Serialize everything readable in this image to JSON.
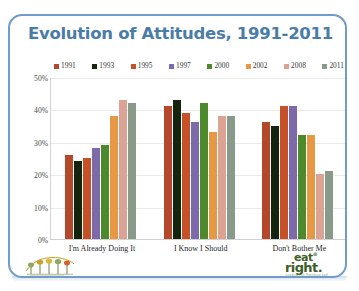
{
  "chart": {
    "title": "Evolution of Attitudes, 1991-2011",
    "title_color": "#4a7ca8",
    "border_color": "#6f9ccb"
  },
  "legend": {
    "items": [
      {
        "label": "1991",
        "color": "#b5472a"
      },
      {
        "label": "1993",
        "color": "#14240e"
      },
      {
        "label": "1995",
        "color": "#c65127"
      },
      {
        "label": "1997",
        "color": "#7e6aa8"
      },
      {
        "label": "2000",
        "color": "#4c8a2b"
      },
      {
        "label": "2002",
        "color": "#e69844"
      },
      {
        "label": "2008",
        "color": "#dba394"
      },
      {
        "label": "2011",
        "color": "#8a9a8a"
      }
    ]
  },
  "yaxis": {
    "ticks": [
      "50%",
      "40%",
      "30%",
      "20%",
      "10%",
      "0%"
    ]
  },
  "logos": {
    "right": {
      "line1": "eat",
      "line2": "right",
      "trademark": "®",
      "period": ".",
      "subtitle": "Academy of Nutrition and Dietetics"
    }
  },
  "chart_data": {
    "type": "bar",
    "title": "Evolution of Attitudes, 1991-2011",
    "xlabel": "",
    "ylabel": "",
    "ylim": [
      0,
      50
    ],
    "yunit": "%",
    "ytick_values": [
      0,
      10,
      20,
      30,
      40,
      50
    ],
    "grid": true,
    "legend_position": "top",
    "categories": [
      "I'm Already Doing It",
      "I Know I Should",
      "Don't Bother Me"
    ],
    "series": [
      {
        "name": "1991",
        "color": "#b5472a",
        "values": [
          26,
          41,
          36
        ]
      },
      {
        "name": "1993",
        "color": "#14240e",
        "values": [
          24,
          43,
          35
        ]
      },
      {
        "name": "1995",
        "color": "#c65127",
        "values": [
          25,
          39,
          41
        ]
      },
      {
        "name": "1997",
        "color": "#7e6aa8",
        "values": [
          28,
          36,
          41
        ]
      },
      {
        "name": "2000",
        "color": "#4c8a2b",
        "values": [
          29,
          42,
          32
        ]
      },
      {
        "name": "2002",
        "color": "#e69844",
        "values": [
          38,
          33,
          32
        ]
      },
      {
        "name": "2008",
        "color": "#dba394",
        "values": [
          43,
          38,
          20
        ]
      },
      {
        "name": "2011",
        "color": "#8a9a8a",
        "values": [
          42,
          38,
          21
        ]
      }
    ]
  }
}
